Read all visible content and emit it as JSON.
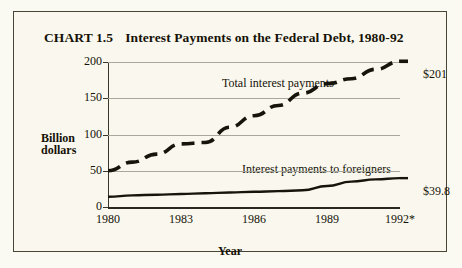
{
  "title": {
    "number": "CHART 1.5",
    "text": "Interest Payments on the Federal Debt, 1980-92"
  },
  "axis": {
    "y_title_line1": "Billion",
    "y_title_line2": "dollars",
    "x_title": "Year"
  },
  "chart_data": {
    "type": "line",
    "xlabel": "Year",
    "ylabel": "Billion dollars",
    "xlim": [
      1980,
      1992
    ],
    "ylim": [
      0,
      200
    ],
    "yticks": [
      0,
      50,
      100,
      150,
      200
    ],
    "ytick_labels": [
      "0",
      "50",
      "100",
      "150",
      "200"
    ],
    "xticks": [
      1980,
      1983,
      1986,
      1989,
      1992
    ],
    "xtick_labels": [
      "1980",
      "1983",
      "1986",
      "1989",
      "1992*"
    ],
    "grid": "horizontal",
    "legend": "inline-annotations",
    "x": [
      1980,
      1981,
      1982,
      1983,
      1984,
      1985,
      1986,
      1987,
      1988,
      1989,
      1990,
      1991,
      1992
    ],
    "series": [
      {
        "name": "Total interest payments",
        "style": "dashed",
        "label_x": 1985.2,
        "end_label": "$201",
        "end_value": 201,
        "values": [
          50,
          62,
          73,
          87,
          89,
          110,
          126,
          140,
          157,
          170,
          177,
          190,
          201
        ]
      },
      {
        "name": "Interest payments to foreigners",
        "style": "solid",
        "label_x": 1986.0,
        "end_label": "$39.8",
        "end_value": 39.8,
        "values": [
          14,
          16,
          17,
          18,
          19,
          20,
          21,
          22,
          23,
          29,
          35,
          38,
          39.8
        ]
      }
    ],
    "annotations": [
      {
        "text": "Total interest payments",
        "kind": "series-label"
      },
      {
        "text": "Interest payments to foreigners",
        "kind": "series-label"
      },
      {
        "text": "$201",
        "kind": "end-value"
      },
      {
        "text": "$39.8",
        "kind": "end-value"
      }
    ],
    "footnote_marker": "*"
  },
  "colors": {
    "background": "#faf8ee",
    "border": "#4a4636",
    "ink": "#151208",
    "gridline": "#a9a89c",
    "series_line": "#17140c"
  }
}
